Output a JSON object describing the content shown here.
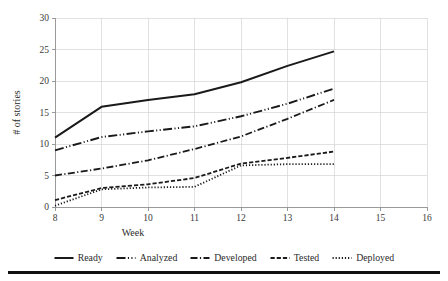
{
  "chart_data": {
    "type": "line",
    "title": "",
    "xlabel": "Week",
    "ylabel": "# of stories",
    "x": [
      8,
      9,
      10,
      11,
      12,
      13,
      14
    ],
    "xlim": [
      8,
      16
    ],
    "ylim": [
      0,
      30
    ],
    "xticks": [
      "8",
      "9",
      "10",
      "11",
      "12",
      "13",
      "14",
      "15",
      "16"
    ],
    "yticks": [
      "0",
      "5",
      "10",
      "15",
      "20",
      "25",
      "30"
    ],
    "grid": true,
    "legend_position": "bottom",
    "series": [
      {
        "name": "Ready",
        "values": [
          11.0,
          15.9,
          17.0,
          17.9,
          19.8,
          22.4,
          24.7
        ]
      },
      {
        "name": "Analyzed",
        "values": [
          9.0,
          11.1,
          12.0,
          12.8,
          14.4,
          16.4,
          18.8
        ]
      },
      {
        "name": "Developed",
        "values": [
          5.0,
          6.1,
          7.4,
          9.2,
          11.2,
          14.0,
          17.0
        ]
      },
      {
        "name": "Tested",
        "values": [
          1.1,
          3.0,
          3.6,
          4.6,
          6.9,
          7.8,
          8.8
        ]
      },
      {
        "name": "Deployed",
        "values": [
          0.2,
          2.8,
          3.1,
          3.2,
          6.6,
          6.8,
          6.8
        ]
      }
    ]
  },
  "axes": {
    "y_title": "# of stories",
    "x_title": "Week",
    "y_tick_labels": [
      "0",
      "5",
      "10",
      "15",
      "20",
      "25",
      "30"
    ],
    "x_tick_labels": [
      "8",
      "9",
      "10",
      "11",
      "12",
      "13",
      "14",
      "15",
      "16"
    ]
  },
  "legend": {
    "items": [
      {
        "label": "Ready",
        "style": "solid"
      },
      {
        "label": "Analyzed",
        "style": "dash-dot-dot"
      },
      {
        "label": "Developed",
        "style": "dash-dot"
      },
      {
        "label": "Tested",
        "style": "dashed"
      },
      {
        "label": "Deployed",
        "style": "dotted"
      }
    ]
  },
  "colors": {
    "series": "#1a1a1a",
    "grid": "#d4d4d4",
    "axis": "#8f8f8f",
    "text": "#2b2b2b",
    "background": "#ffffff"
  }
}
